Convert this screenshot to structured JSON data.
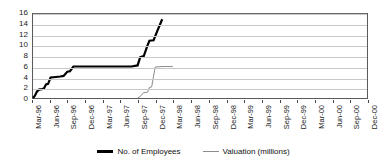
{
  "chart_data": {
    "type": "line",
    "title": "",
    "subtitle": "",
    "xlabel": "",
    "ylabel": "",
    "grid": true,
    "legend_position": "bottom",
    "ylim": [
      0,
      16
    ],
    "yticks": [
      0,
      2,
      4,
      6,
      8,
      10,
      12,
      14,
      16
    ],
    "categories": [
      "Mar-96",
      "Jun-96",
      "Sep-96",
      "Dec-96",
      "Mar-97",
      "Jun-97",
      "Sep-97",
      "Dec-97",
      "Mar-98",
      "Jun-98",
      "Sep-98",
      "Dec-98",
      "Mar-99",
      "Jun-99",
      "Sep-99",
      "Dec-99",
      "Mar-00",
      "Jun-00",
      "Sep-00",
      "Dec-00"
    ],
    "series": [
      {
        "name": "No. of Employees",
        "color": "#000000",
        "width": 2.2,
        "values": [
          0,
          2,
          2,
          4,
          4,
          5,
          6,
          6,
          6,
          15,
          null,
          null,
          null,
          null,
          null,
          null,
          null,
          null,
          null,
          null
        ]
      },
      {
        "name": "Valuation (millions)",
        "color": "#8c8c8c",
        "width": 1,
        "values": [
          null,
          null,
          null,
          null,
          null,
          null,
          null,
          0,
          2,
          6,
          null,
          null,
          null,
          null,
          null,
          null,
          null,
          null,
          null,
          null
        ]
      }
    ],
    "employees_points": [
      [
        0.0,
        0
      ],
      [
        0.1,
        0.4
      ],
      [
        0.22,
        1.2
      ],
      [
        0.34,
        1.6
      ],
      [
        0.5,
        1.7
      ],
      [
        0.62,
        1.8
      ],
      [
        0.74,
        2.6
      ],
      [
        0.86,
        2.7
      ],
      [
        1.0,
        3.9
      ],
      [
        1.3,
        4.0
      ],
      [
        1.55,
        4.1
      ],
      [
        1.74,
        4.2
      ],
      [
        1.95,
        5.0
      ],
      [
        2.1,
        5.1
      ],
      [
        2.3,
        6.0
      ],
      [
        2.95,
        6.0
      ],
      [
        3.6,
        6.0
      ],
      [
        4.3,
        6.0
      ],
      [
        5.05,
        6.0
      ],
      [
        5.6,
        6.0
      ],
      [
        5.95,
        6.2
      ],
      [
        6.1,
        7.8
      ],
      [
        6.3,
        8.0
      ],
      [
        6.5,
        9.9
      ],
      [
        6.62,
        10.9
      ],
      [
        6.86,
        11.0
      ],
      [
        7.05,
        12.6
      ],
      [
        7.35,
        15.0
      ]
    ],
    "valuation_points": [
      [
        5.95,
        0
      ],
      [
        6.1,
        0.3
      ],
      [
        6.28,
        1.0
      ],
      [
        6.52,
        1.1
      ],
      [
        6.62,
        2.0
      ],
      [
        6.75,
        2.1
      ],
      [
        6.95,
        5.9
      ],
      [
        7.4,
        6.0
      ],
      [
        7.95,
        6.0
      ]
    ]
  },
  "legend": {
    "entries": [
      {
        "label": "No. of Employees"
      },
      {
        "label": "Valuation (millions)"
      }
    ]
  }
}
